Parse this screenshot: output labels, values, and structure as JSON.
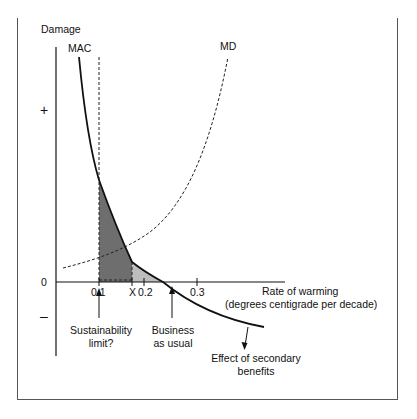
{
  "diagram": {
    "y_axis_label": "Damage",
    "x_axis_label_line1": "Rate of warming",
    "x_axis_label_line2": "(degrees centigrade per decade)",
    "origin_label": "0",
    "plus_sign": "+",
    "minus_sign": "–",
    "curves": {
      "mac_label": "MAC",
      "md_label": "MD"
    },
    "x_ticks": [
      "0.1",
      "X",
      "0.2",
      "0.3"
    ],
    "annotations": {
      "sustainability_line1": "Sustainability",
      "sustainability_line2": "limit?",
      "business_line1": "Business",
      "business_line2": "as usual",
      "secondary_line1": "Effect of secondary",
      "secondary_line2": "benefits"
    },
    "colors": {
      "curve": "#111111",
      "dark_shade": "#6e6e6e",
      "light_shade": "#bdbdbd",
      "frame": "#555555"
    }
  }
}
